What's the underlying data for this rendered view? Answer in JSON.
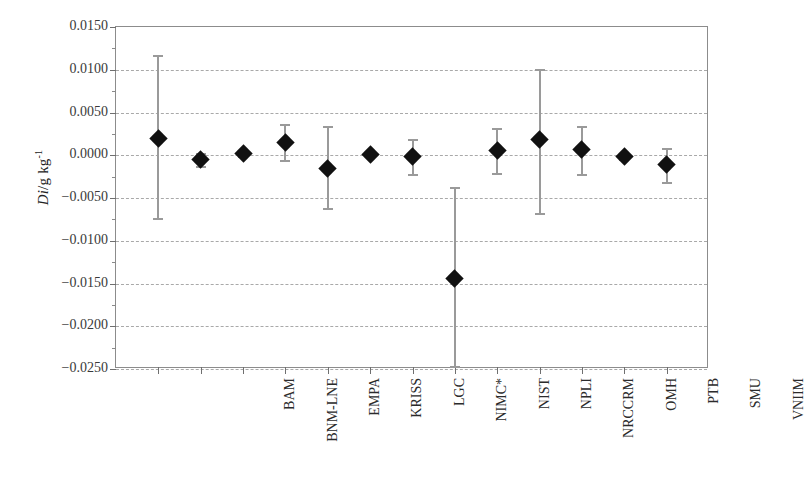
{
  "chart_data": {
    "type": "scatter",
    "title": "",
    "subtitle": "",
    "xlabel": "",
    "ylabel": "Di/g kg⁻¹",
    "ylabel_parts": {
      "italic": "Di",
      "rest": "/g kg",
      "exponent": "-1"
    },
    "ylim": [
      -0.025,
      0.015
    ],
    "ytick_step": 0.005,
    "yticks": [
      0.015,
      0.01,
      0.005,
      0.0,
      -0.005,
      -0.01,
      -0.015,
      -0.02,
      -0.025
    ],
    "ytick_labels": [
      "0.0150",
      "0.0100",
      "0.0050",
      "0.0000",
      "−0.0050",
      "−0.0100",
      "−0.0150",
      "−0.0200",
      "−0.0250"
    ],
    "grid": true,
    "grid_style": "dashed",
    "legend": "none",
    "marker": "filled-diamond",
    "marker_color": "#111111",
    "errorbar_color": "#9a9a9a",
    "categories": [
      "BAM",
      "BNM-LNE",
      "EMPA",
      "KRISS",
      "LGC",
      "NIMC*",
      "NIST",
      "NPLI",
      "NRCCRM",
      "OMH",
      "PTB",
      "SMU",
      "VNIIM"
    ],
    "values": [
      0.002,
      -0.0005,
      0.0002,
      0.0015,
      -0.0015,
      0.0001,
      -0.0002,
      -0.0144,
      0.0005,
      0.0018,
      0.0007,
      -0.0001,
      -0.0011
    ],
    "err_low": [
      -0.0073,
      -0.0013,
      -0.0001,
      -0.0006,
      -0.0062,
      -0.0001,
      -0.0022,
      -0.0246,
      -0.0021,
      -0.0068,
      -0.0022,
      -0.0004,
      -0.0031
    ],
    "err_high": [
      0.0117,
      0.0003,
      0.0005,
      0.0036,
      0.0034,
      0.0003,
      0.0019,
      -0.0037,
      0.0032,
      0.0101,
      0.0034,
      0.0002,
      0.0008
    ]
  }
}
